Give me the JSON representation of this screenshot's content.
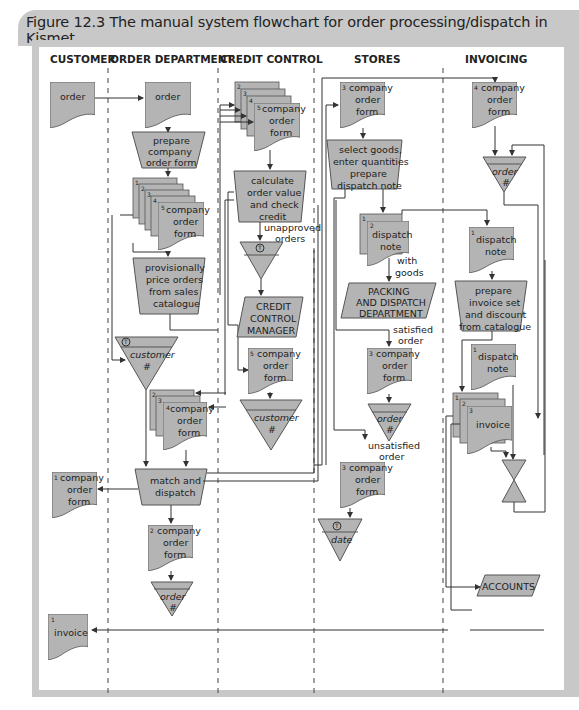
{
  "figure": {
    "title": "Figure 12.3 The manual system flowchart for order processing/dispatch in Kismet"
  },
  "lanes": [
    "CUSTOMER",
    "ORDER DEPARTMENT",
    "CREDIT CONTROL",
    "STORES",
    "INVOICING"
  ],
  "nodes": {
    "customer_order": {
      "label": "order"
    },
    "od_order": {
      "label": "order"
    },
    "prepare_form": {
      "lines": [
        "prepare",
        "company",
        "order form"
      ]
    },
    "od_forms_stack": {
      "copies": [
        "1",
        "2",
        "3",
        "4",
        "5"
      ],
      "lines": [
        "company",
        "order",
        "form"
      ]
    },
    "provisional_price": {
      "lines": [
        "provisionally",
        "price orders",
        "from sales",
        "catalogue"
      ]
    },
    "file_customer": {
      "lines": [
        "customer",
        "#"
      ],
      "mark": "T"
    },
    "od_forms_returned": {
      "copies": [
        "2",
        "3",
        "4"
      ],
      "lines": [
        "company",
        "order",
        "form"
      ]
    },
    "match_dispatch": {
      "lines": [
        "match and",
        "dispatch"
      ]
    },
    "customer_form": {
      "copy": "1",
      "lines": [
        "company",
        "order",
        "form"
      ]
    },
    "od_form_2": {
      "copy": "2",
      "lines": [
        "company",
        "order",
        "form"
      ]
    },
    "file_order_od": {
      "lines": [
        "order",
        "#"
      ]
    },
    "customer_invoice": {
      "copy": "1",
      "label": "invoice"
    },
    "cc_forms_stack": {
      "copies": [
        "2",
        "3",
        "4",
        "5"
      ],
      "lines": [
        "company",
        "order",
        "form"
      ]
    },
    "calc_credit": {
      "lines": [
        "calculate",
        "order value",
        "and check",
        "credit"
      ]
    },
    "unapproved_label": {
      "lines": [
        "unapproved",
        "orders"
      ]
    },
    "file_unapproved": {
      "mark": "T"
    },
    "credit_manager": {
      "lines": [
        "CREDIT",
        "CONTROL",
        "MANAGER"
      ]
    },
    "cc_form_5": {
      "copy": "5",
      "lines": [
        "company",
        "order",
        "form"
      ]
    },
    "file_customer_cc": {
      "lines": [
        "customer",
        "#"
      ]
    },
    "stores_form_3": {
      "copy": "3",
      "lines": [
        "company",
        "order",
        "form"
      ]
    },
    "select_goods": {
      "lines": [
        "select goods,",
        "enter quantities",
        "prepare",
        "dispatch note"
      ]
    },
    "dispatch_notes": {
      "copies": [
        "1",
        "2"
      ],
      "lines": [
        "dispatch",
        "note"
      ]
    },
    "with_goods_label": {
      "lines": [
        "with",
        "goods"
      ]
    },
    "packing_dept": {
      "lines": [
        "PACKING",
        "AND DISPATCH",
        "DEPARTMENT"
      ]
    },
    "satisfied_label": {
      "lines": [
        "satisfied",
        "order"
      ]
    },
    "stores_form_3b": {
      "copy": "3",
      "lines": [
        "company",
        "order",
        "form"
      ]
    },
    "file_order_stores": {
      "lines": [
        "order",
        "#"
      ]
    },
    "unsatisfied_label": {
      "lines": [
        "unsatisfied",
        "order"
      ]
    },
    "stores_form_3c": {
      "copy": "3",
      "lines": [
        "company",
        "order",
        "form"
      ]
    },
    "file_date": {
      "lines": [
        "date"
      ],
      "mark": "T"
    },
    "inv_form_4": {
      "copy": "4",
      "lines": [
        "company",
        "order",
        "form"
      ]
    },
    "file_order_inv": {
      "lines": [
        "order",
        "#"
      ]
    },
    "inv_dispatch_note": {
      "copy": "1",
      "lines": [
        "dispatch",
        "note"
      ]
    },
    "prepare_invoice": {
      "lines": [
        "prepare",
        "invoice set",
        "and discount",
        "from catalogue"
      ]
    },
    "inv_dispatch_note_b": {
      "copy": "1",
      "lines": [
        "dispatch",
        "note"
      ]
    },
    "invoices_stack": {
      "copies": [
        "1",
        "2",
        "3"
      ],
      "label": "invoice"
    },
    "accounts": {
      "label": "ACCOUNTS"
    }
  },
  "colors": {
    "shape_fill": "#b4b4b4",
    "frame": "#c8c8c8",
    "line": "#333333"
  }
}
